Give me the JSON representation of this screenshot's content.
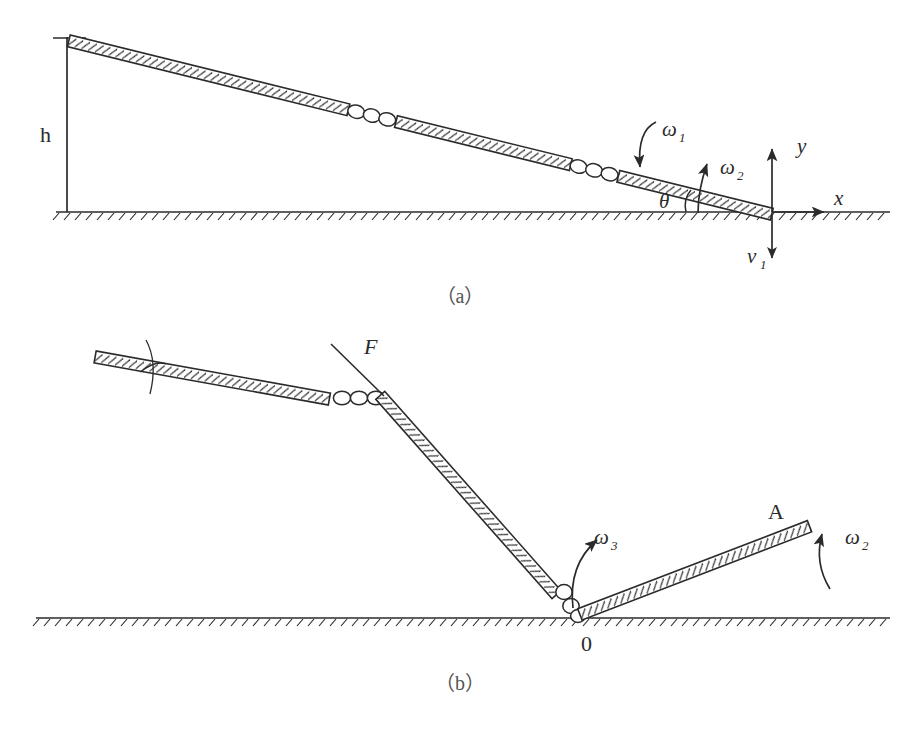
{
  "figure": {
    "background_color": "#ffffff",
    "ink_color": "#2b2b2b",
    "rod_fill_color": "#ffffff",
    "width": 914,
    "height": 733
  },
  "panels": [
    {
      "id": "a",
      "caption": "（a）",
      "caption_x": 460,
      "caption_y": 303,
      "description": "Slender hinged rod inclined at angle theta above the ground, falling with angular rates omega1 and omega2; contact end at origin of x-y axes with downward velocity v1; drop height h.",
      "labels": [
        {
          "name": "height-label-h",
          "text": "h",
          "sub": "",
          "x": 40,
          "y": 142,
          "style": "upright",
          "size": 22
        },
        {
          "name": "omega1-label",
          "text": "ω",
          "sub": "1",
          "x": 662,
          "y": 136,
          "style": "italic",
          "size": 21
        },
        {
          "name": "omega2-label",
          "text": "ω",
          "sub": "2",
          "x": 720,
          "y": 174,
          "style": "italic",
          "size": 21
        },
        {
          "name": "theta-label",
          "text": "θ",
          "sub": "",
          "x": 659,
          "y": 208,
          "style": "italic",
          "size": 21
        },
        {
          "name": "x-axis-label",
          "text": "x",
          "sub": "",
          "x": 834,
          "y": 205,
          "style": "italic",
          "size": 21
        },
        {
          "name": "y-axis-label",
          "text": "y",
          "sub": "",
          "x": 797,
          "y": 153,
          "style": "italic",
          "size": 21
        },
        {
          "name": "velocity-label-v1",
          "text": "v",
          "sub": "1",
          "x": 747,
          "y": 263,
          "style": "italic",
          "size": 21
        }
      ]
    },
    {
      "id": "b",
      "caption": "（b）",
      "caption_x": 460,
      "caption_y": 690,
      "description": "Same rod after impact: upper segment bent, impulsive force F applied at the upper hinge, lower link pivoting about contact point 0 with angular rate omega3, and the rebounding link toward tip A rotating at omega2.",
      "labels": [
        {
          "name": "force-label-F",
          "text": "F",
          "sub": "",
          "x": 364,
          "y": 354,
          "style": "italic",
          "size": 22
        },
        {
          "name": "omega3-label",
          "text": "ω",
          "sub": "3",
          "x": 594,
          "y": 544,
          "style": "italic",
          "size": 21
        },
        {
          "name": "omega2-label-b",
          "text": "ω",
          "sub": "2",
          "x": 845,
          "y": 544,
          "style": "italic",
          "size": 21
        },
        {
          "name": "point-label-A",
          "text": "A",
          "sub": "",
          "x": 768,
          "y": 519,
          "style": "upright",
          "size": 22
        },
        {
          "name": "origin-label-0",
          "text": "0",
          "sub": "",
          "x": 581,
          "y": 651,
          "style": "upright",
          "size": 22
        }
      ]
    }
  ],
  "ground": {
    "panel_a": {
      "name": "ground-line-a",
      "x1": 56,
      "x2": 890,
      "y": 212
    },
    "panel_b": {
      "name": "ground-line-b",
      "x1": 36,
      "x2": 890,
      "y": 618
    }
  },
  "axes": {
    "x_axis": {
      "name": "x-axis-arrow",
      "x1": 772,
      "x2": 828,
      "y": 212
    },
    "y_axis": {
      "name": "y-axis-arrow",
      "x": 772,
      "y1": 212,
      "y2": 145
    },
    "v1_arrow": {
      "name": "v1-arrow",
      "x": 772,
      "y1": 214,
      "y2": 262
    },
    "height_line": {
      "name": "height-dimension-line",
      "x": 67,
      "y1": 37,
      "y2": 212
    }
  },
  "rods": {
    "panel_a": {
      "name": "inclined-rod-a",
      "tip_start": {
        "x": 70,
        "y": 36
      },
      "tip_end": {
        "x": 772,
        "y": 209
      },
      "hinge_positions": [
        0.4,
        0.72
      ],
      "thickness": 11
    },
    "panel_b": {
      "upper_segment": {
        "name": "upper-rod-b",
        "start": {
          "x": 96,
          "y": 352
        },
        "end": {
          "x": 330,
          "y": 394
        }
      },
      "hinge_segment": {
        "name": "hinge-links-b",
        "start": {
          "x": 330,
          "y": 394
        },
        "end": {
          "x": 383,
          "y": 398
        }
      },
      "middle_segment": {
        "name": "middle-rod-b",
        "start": {
          "x": 383,
          "y": 398
        },
        "end": {
          "x": 560,
          "y": 595
        }
      },
      "lower_segment": {
        "name": "lower-rod-b",
        "start": {
          "x": 560,
          "y": 595
        },
        "end": {
          "x": 583,
          "y": 617
        }
      },
      "rebound_segment": {
        "name": "rebound-rod-b",
        "start": {
          "x": 583,
          "y": 617
        },
        "end": {
          "x": 812,
          "y": 529
        }
      },
      "force_line": {
        "name": "force-line-F",
        "x1": 383,
        "y1": 398,
        "x2": 333,
        "y2": 345
      },
      "cross_marker": {
        "name": "cross-marker-b",
        "x": 152,
        "y": 368
      }
    }
  }
}
